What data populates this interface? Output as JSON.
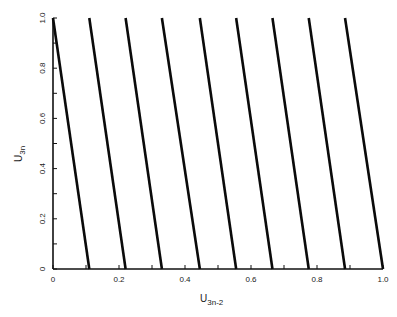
{
  "chart_data": {
    "type": "scatter",
    "title": "",
    "xlabel": "U",
    "xlabel_sub": "3n-2",
    "ylabel": "U",
    "ylabel_sub": "3n",
    "xlim": [
      0,
      1.0
    ],
    "ylim": [
      0,
      1.0
    ],
    "grid": false,
    "legend": null,
    "x_ticks": [
      "0",
      "0.2",
      "0.4",
      "0.6",
      "0.8",
      "1.0"
    ],
    "y_ticks": [
      "0",
      "0.2",
      "0.4",
      "0.6",
      "0.8",
      "1.0"
    ],
    "lines": [
      {
        "x_top": 0.0,
        "x_bottom": 0.11
      },
      {
        "x_top": 0.11,
        "x_bottom": 0.22
      },
      {
        "x_top": 0.22,
        "x_bottom": 0.33
      },
      {
        "x_top": 0.33,
        "x_bottom": 0.445
      },
      {
        "x_top": 0.445,
        "x_bottom": 0.555
      },
      {
        "x_top": 0.555,
        "x_bottom": 0.665
      },
      {
        "x_top": 0.665,
        "x_bottom": 0.775
      },
      {
        "x_top": 0.775,
        "x_bottom": 0.885
      },
      {
        "x_top": 0.885,
        "x_bottom": 1.0
      }
    ]
  }
}
